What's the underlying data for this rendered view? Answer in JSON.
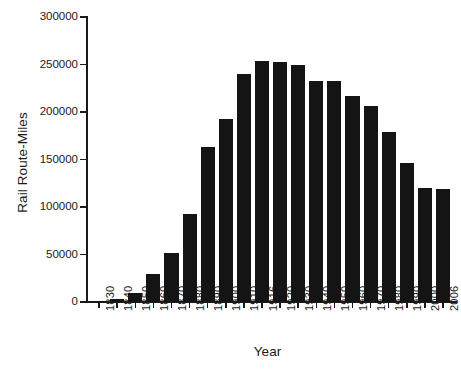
{
  "chart_data": {
    "type": "bar",
    "title": "",
    "xlabel": "Year",
    "ylabel": "Rail Route-Miles",
    "categories": [
      "1830",
      "1840",
      "1850",
      "1860",
      "1870",
      "1880",
      "1890",
      "1900",
      "1910",
      "1916",
      "1920",
      "1930",
      "1940",
      "1950",
      "1960",
      "1970",
      "1980",
      "1990",
      "2000",
      "2006"
    ],
    "values": [
      40,
      2800,
      9000,
      30000,
      52000,
      93000,
      163000,
      193000,
      240000,
      254000,
      253000,
      249000,
      233000,
      233000,
      217000,
      206000,
      179000,
      146000,
      120000,
      119000
    ],
    "ylim": [
      0,
      300000
    ],
    "yticks": [
      0,
      50000,
      100000,
      150000,
      200000,
      250000,
      300000
    ],
    "ytick_labels": [
      "0",
      "50000",
      "100000",
      "150000",
      "200000",
      "250000",
      "300000"
    ],
    "grid": false,
    "legend": null,
    "bar_color": "#141414",
    "axis_color": "#1a1a1a",
    "background": "#ffffff"
  }
}
